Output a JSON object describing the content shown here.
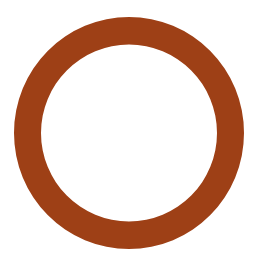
{
  "canvas": {
    "width": 262,
    "height": 266,
    "background_color": "#ffffff"
  },
  "figure": {
    "name": "ring",
    "shape": "annulus",
    "description": "Solid rust-brown ring (circular outline / donut) centered on a white background",
    "fill_color": "#9e4016",
    "center_x": 129,
    "center_y": 133,
    "outer_radius_x": 115,
    "outer_radius_y": 116,
    "inner_radius_x": 88,
    "inner_radius_y": 88.5,
    "stroke_thickness": 27,
    "outer_left": 14,
    "outer_right": 244,
    "outer_top": 17,
    "outer_bottom": 249,
    "inner_left": 42,
    "inner_right": 218,
    "inner_top": 45,
    "inner_bottom": 222
  },
  "text": {
    "has_text": "false",
    "labels": []
  }
}
